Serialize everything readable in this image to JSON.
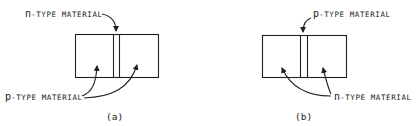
{
  "figures": [
    {
      "id": "a",
      "caption": "(a)",
      "top_label": {
        "prefix": "n",
        "rest": "-TYPE MATERIAL"
      },
      "bottom_label": {
        "prefix": "p",
        "rest": "-TYPE MATERIAL"
      },
      "description": "p-n-p arrangement: thin n-type layer between two p-type regions"
    },
    {
      "id": "b",
      "caption": "(b)",
      "top_label": {
        "prefix": "p",
        "rest": "-TYPE MATERIAL"
      },
      "bottom_label": {
        "prefix": "n",
        "rest": "-TYPE MATERIAL"
      },
      "description": "n-p-n arrangement: thin p-type layer between two n-type regions"
    }
  ],
  "colors": {
    "ink": "#222222",
    "background": "#ffffff"
  }
}
